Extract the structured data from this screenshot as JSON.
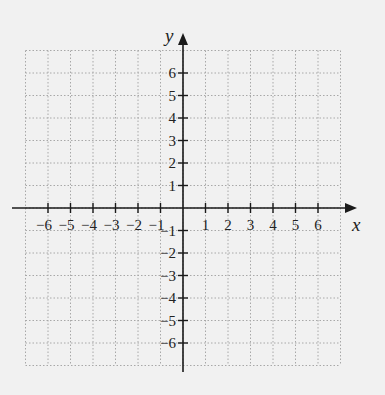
{
  "diagram": {
    "type": "coordinate-plane",
    "x_axis": {
      "label": "x",
      "min": -7,
      "max": 7,
      "tick_labels": [
        "−6",
        "−5",
        "−4",
        "−3",
        "−2",
        "−1",
        "1",
        "2",
        "3",
        "4",
        "5",
        "6"
      ],
      "tick_values": [
        -6,
        -5,
        -4,
        -3,
        -2,
        -1,
        1,
        2,
        3,
        4,
        5,
        6
      ]
    },
    "y_axis": {
      "label": "y",
      "min": -7,
      "max": 7,
      "tick_labels": [
        "6",
        "5",
        "4",
        "3",
        "2",
        "1",
        "−1",
        "−2",
        "−3",
        "−4",
        "−5",
        "−6"
      ],
      "tick_values": [
        6,
        5,
        4,
        3,
        2,
        1,
        -1,
        -2,
        -3,
        -4,
        -5,
        -6
      ]
    },
    "grid": {
      "style": "dotted",
      "color": "#a8a8a8",
      "extent": [
        -7,
        7
      ]
    },
    "colors": {
      "background": "#f1f1f1",
      "axis": "#1a1a1a",
      "text": "#222222"
    }
  }
}
